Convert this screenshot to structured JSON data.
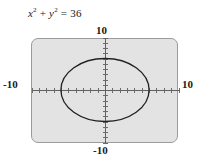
{
  "figure": {
    "type": "graphing-calculator-screen",
    "equation": {
      "lhs_term1_base": "x",
      "lhs_term1_exp": "2",
      "operator": "+",
      "lhs_term2_base": "y",
      "lhs_term2_exp": "2",
      "equals": "=",
      "rhs": "36",
      "full_text": "x² + y² = 36"
    },
    "axis_labels": {
      "top": "10",
      "bottom": "-10",
      "left": "-10",
      "right": "10"
    },
    "colors": {
      "screen_fill": "#e3e3e3",
      "screen_border": "#9b9b9b",
      "axis": "#606060",
      "curve": "#222222",
      "text": "#1a1a1a",
      "page_background": "#ffffff"
    }
  },
  "chart_data": {
    "type": "scatter",
    "xlabel": "",
    "ylabel": "",
    "xlim": [
      -10,
      10
    ],
    "ylim": [
      -10,
      10
    ],
    "grid": false,
    "legend": null,
    "xticks": [
      -10,
      -9,
      -8,
      -7,
      -6,
      -5,
      -4,
      -3,
      -2,
      -1,
      1,
      2,
      3,
      4,
      5,
      6,
      7,
      8,
      9,
      10
    ],
    "yticks": [
      -10,
      -9,
      -8,
      -7,
      -6,
      -5,
      -4,
      -3,
      -2,
      -1,
      1,
      2,
      3,
      4,
      5,
      6,
      7,
      8,
      9,
      10
    ],
    "xtick_labels_shown": [
      "-10",
      "10"
    ],
    "ytick_labels_shown": [
      "-10",
      "10"
    ],
    "series": [
      {
        "name": "x^2 + y^2 = 36",
        "kind": "implicit-circle",
        "center": [
          0,
          0
        ],
        "radius": 6,
        "color": "#222222"
      }
    ],
    "annotations": [
      {
        "text": "x² + y² = 36",
        "position": "above-plot-left"
      }
    ]
  }
}
